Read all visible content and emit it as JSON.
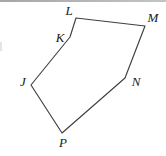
{
  "figure": {
    "stroke_color": "#3f3f3f",
    "label_color": "#1a1a1a",
    "top_border_color": "#a6a6a6",
    "vertices": [
      {
        "name": "L",
        "x": 76,
        "y": 18
      },
      {
        "name": "M",
        "x": 145,
        "y": 26
      },
      {
        "name": "N",
        "x": 125,
        "y": 78
      },
      {
        "name": "P",
        "x": 62,
        "y": 133
      },
      {
        "name": "J",
        "x": 31,
        "y": 85
      },
      {
        "name": "K",
        "x": 70,
        "y": 37
      }
    ],
    "labels": [
      {
        "text": "L",
        "x": 69,
        "y": 15
      },
      {
        "text": "M",
        "x": 153,
        "y": 22
      },
      {
        "text": "N",
        "x": 136,
        "y": 86
      },
      {
        "text": "P",
        "x": 63,
        "y": 147
      },
      {
        "text": "J",
        "x": 23,
        "y": 86
      },
      {
        "text": "K",
        "x": 60,
        "y": 42
      }
    ]
  }
}
